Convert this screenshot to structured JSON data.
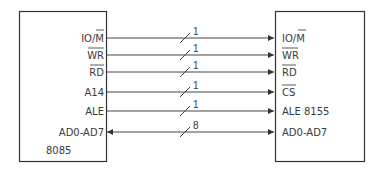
{
  "left_chip": {
    "name": "8085",
    "pins": [
      "IO/M",
      "WR",
      "RD",
      "A14",
      "ALE",
      "AD0-AD7"
    ]
  },
  "right_chip": {
    "name": "8155",
    "pins": [
      "IO/M",
      "WR",
      "RD",
      "CS",
      "ALE 8155",
      "AD0-AD7"
    ]
  },
  "connections": [
    {
      "from": "IO/M",
      "to": "IO/M",
      "width": "1",
      "direction": "right"
    },
    {
      "from": "WR",
      "to": "WR",
      "width": "1",
      "direction": "right"
    },
    {
      "from": "RD",
      "to": "RD",
      "width": "1",
      "direction": "right"
    },
    {
      "from": "A14",
      "to": "CS",
      "width": "1",
      "direction": "right"
    },
    {
      "from": "ALE",
      "to": "ALE",
      "width": "1",
      "direction": "right"
    },
    {
      "from": "AD0-AD7",
      "to": "AD0-AD7",
      "width": "8",
      "direction": "bidirectional"
    }
  ],
  "colors": {
    "line": "#444444",
    "box": "#333333"
  }
}
